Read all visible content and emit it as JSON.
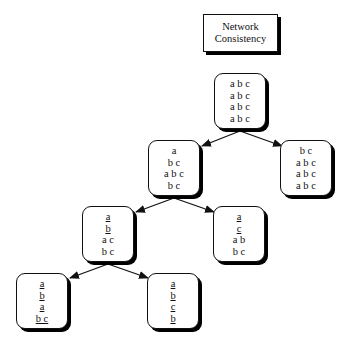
{
  "title": {
    "line1": "Network",
    "line2": "Consistency"
  },
  "nodes": {
    "root": {
      "lines": [
        {
          "text": "a b c",
          "underline": false
        },
        {
          "text": "a b c",
          "underline": false
        },
        {
          "text": "a b c",
          "underline": false
        },
        {
          "text": "a b c",
          "underline": false
        }
      ]
    },
    "level2_left": {
      "lines": [
        {
          "text": "a",
          "underline": false
        },
        {
          "text": "b c",
          "underline": false
        },
        {
          "text": "a b c",
          "underline": false
        },
        {
          "text": "b c",
          "underline": false
        }
      ]
    },
    "level2_right": {
      "lines": [
        {
          "text": "b c",
          "underline": false
        },
        {
          "text": "a b c",
          "underline": false
        },
        {
          "text": "a b c",
          "underline": false
        },
        {
          "text": "a b c",
          "underline": false
        }
      ]
    },
    "level3_left": {
      "lines": [
        {
          "text": "a",
          "underline": true
        },
        {
          "text": "b",
          "underline": true
        },
        {
          "text": "a c",
          "underline": false
        },
        {
          "text": "b c",
          "underline": false
        }
      ]
    },
    "level3_right": {
      "lines": [
        {
          "text": "a",
          "underline": true
        },
        {
          "text": "c",
          "underline": true
        },
        {
          "text": "a b",
          "underline": false
        },
        {
          "text": "b c",
          "underline": false
        }
      ]
    },
    "level4_left": {
      "lines": [
        {
          "text": "a",
          "underline": true
        },
        {
          "text": "b",
          "underline": true
        },
        {
          "text": "a",
          "underline": true
        },
        {
          "text": "b c",
          "underline": true
        }
      ]
    },
    "level4_right": {
      "lines": [
        {
          "text": "a",
          "underline": true
        },
        {
          "text": "b",
          "underline": true
        },
        {
          "text": "c",
          "underline": true
        },
        {
          "text": "b",
          "underline": true
        }
      ]
    }
  },
  "edges": [
    {
      "from": "root",
      "to": "level2_left"
    },
    {
      "from": "root",
      "to": "level2_right"
    },
    {
      "from": "level2_left",
      "to": "level3_left"
    },
    {
      "from": "level2_left",
      "to": "level3_right"
    },
    {
      "from": "level3_left",
      "to": "level4_left"
    },
    {
      "from": "level3_left",
      "to": "level4_right"
    }
  ]
}
